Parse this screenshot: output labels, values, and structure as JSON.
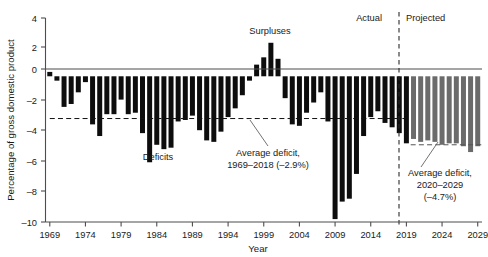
{
  "chart_data": {
    "type": "bar",
    "title": "",
    "xlabel": "Year",
    "ylabel": "Percentage of gross domestic product",
    "xlim": [
      1968.4,
      2029.6
    ],
    "ylim": [
      -10,
      4
    ],
    "ytick_values": [
      4,
      2,
      0,
      -2,
      -4,
      -6,
      -8,
      -10
    ],
    "ytick_labels": [
      "4",
      "2",
      "0",
      "–2",
      "–4",
      "–6",
      "–8",
      "–10"
    ],
    "xtick_values": [
      1969,
      1974,
      1979,
      1984,
      1989,
      1994,
      1999,
      2004,
      2009,
      2014,
      2019,
      2024,
      2029
    ],
    "xtick_labels": [
      "1969",
      "1974",
      "1979",
      "1984",
      "1989",
      "1994",
      "1999",
      "2004",
      "2009",
      "2014",
      "2019",
      "2024",
      "2029"
    ],
    "grid": false,
    "legend": "none",
    "series": [
      {
        "name": "Actual",
        "color": "#0d0d0d",
        "x": [
          1969,
          1970,
          1971,
          1972,
          1973,
          1974,
          1975,
          1976,
          1977,
          1978,
          1979,
          1980,
          1981,
          1982,
          1983,
          1984,
          1985,
          1986,
          1987,
          1988,
          1989,
          1990,
          1991,
          1992,
          1993,
          1994,
          1995,
          1996,
          1997,
          1998,
          1999,
          2000,
          2001,
          2002,
          2003,
          2004,
          2005,
          2006,
          2007,
          2008,
          2009,
          2010,
          2011,
          2012,
          2013,
          2014,
          2015,
          2016,
          2017,
          2018,
          2019
        ],
        "values": [
          0.3,
          -0.3,
          -2.1,
          -1.9,
          -1.1,
          -0.4,
          -3.3,
          -4.1,
          -2.6,
          -2.6,
          -1.6,
          -2.6,
          -2.5,
          -3.9,
          -5.9,
          -4.7,
          -5.0,
          -4.9,
          -3.1,
          -3.0,
          -2.7,
          -3.7,
          -4.4,
          -4.5,
          -3.8,
          -2.8,
          -2.2,
          -1.3,
          -0.3,
          0.8,
          1.3,
          2.3,
          1.2,
          -1.5,
          -3.3,
          -3.4,
          -2.5,
          -1.8,
          -1.1,
          -3.1,
          -9.8,
          -8.6,
          -8.4,
          -6.7,
          -4.1,
          -2.8,
          -2.4,
          -3.2,
          -3.5,
          -3.9,
          -4.6
        ]
      },
      {
        "name": "Projected",
        "color": "#6b6b6b",
        "x": [
          2020,
          2021,
          2022,
          2023,
          2024,
          2025,
          2026,
          2027,
          2028,
          2029
        ],
        "values": [
          -4.3,
          -4.5,
          -4.4,
          -4.5,
          -4.7,
          -4.6,
          -4.6,
          -4.8,
          -5.2,
          -4.8
        ]
      }
    ],
    "reference_lines": [
      {
        "name": "average-deficit-actual",
        "value": -2.9,
        "x_start": 1969,
        "x_end": 2019,
        "style": "dashed",
        "color": "#111111"
      },
      {
        "name": "average-deficit-projected",
        "value": -4.7,
        "x_start": 2019.6,
        "x_end": 2029.6,
        "style": "dashed",
        "color": "#555555"
      }
    ],
    "divider": {
      "name": "actual-projected-divider",
      "x": 2019.55,
      "style": "dashed"
    },
    "annotations": [
      {
        "name": "surpluses-label",
        "text": "Surpluses",
        "x": 1999.0,
        "y": 3.2
      },
      {
        "name": "deficits-label",
        "text": "Deficits",
        "x": 1984.0,
        "y": -5.4
      },
      {
        "name": "actual-label",
        "text": "Actual",
        "x": 2016.5,
        "y": 3.55
      },
      {
        "name": "projected-label",
        "text": "Projected",
        "x": 2024.6,
        "y": 3.55
      }
    ],
    "callouts": [
      {
        "name": "average-deficit-actual-callout",
        "line1": "Average deficit,",
        "line2": "1969–2018 (–2.9%)"
      },
      {
        "name": "average-deficit-projected-callout",
        "line1": "Average deficit,",
        "line2": "2020–2029",
        "line3": "(–4.7%)"
      }
    ]
  }
}
